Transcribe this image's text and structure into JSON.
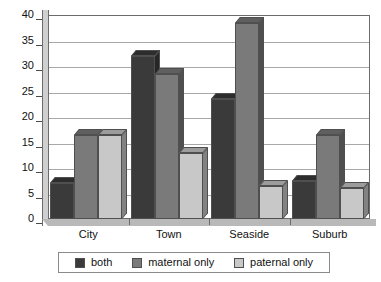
{
  "chart_data": {
    "type": "bar",
    "title": "",
    "xlabel": "",
    "ylabel": "",
    "ylim": [
      0,
      40
    ],
    "ytick_step": 5,
    "yticks": [
      40,
      35,
      30,
      25,
      20,
      15,
      10,
      5,
      0
    ],
    "grid": true,
    "legend_position": "bottom",
    "style": "3d-grouped-columns",
    "categories": [
      "City",
      "Town",
      "Seaside",
      "Suburb"
    ],
    "series": [
      {
        "name": "both",
        "color": "#3a3a3a",
        "values": [
          7,
          32,
          23.5,
          7.5
        ]
      },
      {
        "name": "maternal only",
        "color": "#7a7a7a",
        "values": [
          16.5,
          28.5,
          38.5,
          16.5
        ]
      },
      {
        "name": "paternal only",
        "color": "#c8c8c8",
        "values": [
          16.5,
          13,
          6.5,
          6
        ]
      }
    ]
  },
  "colors": {
    "series_both": "#3a3a3a",
    "series_maternal": "#7a7a7a",
    "series_paternal": "#c8c8c8",
    "grid": "#a8a8a8",
    "frame": "#6b6b6b",
    "floor": "#b9b9b9",
    "background": "#ffffff"
  }
}
